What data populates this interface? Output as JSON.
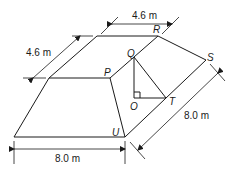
{
  "diagram": {
    "type": "geometry-figure",
    "points": {
      "P": "P",
      "Q": "Q",
      "R": "R",
      "S": "S",
      "T": "T",
      "O": "O",
      "U": "U"
    },
    "dimensions": {
      "top_length": "4.6 m",
      "top_width": "4.6 m",
      "base_length": "8.0 m",
      "base_width": "8.0 m"
    },
    "annotations": {
      "right_angle_at": "O"
    },
    "colors": {
      "line": "#1a1a1a",
      "background": "#ffffff"
    }
  }
}
